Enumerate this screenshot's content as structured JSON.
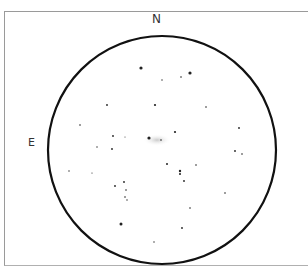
{
  "sketch": {
    "orientation": {
      "north_label": "N",
      "east_label": "E"
    },
    "field_circle": {
      "cx": 162,
      "cy": 150,
      "r": 114,
      "stroke": "#111111"
    },
    "galaxy": {
      "cx": 157,
      "cy": 140,
      "rx": 14,
      "ry": 6,
      "color": "#cfcfcf"
    },
    "stars": [
      {
        "x": 141,
        "y": 68,
        "r": 1.6
      },
      {
        "x": 190,
        "y": 73,
        "r": 1.6
      },
      {
        "x": 181,
        "y": 77,
        "r": 0.8
      },
      {
        "x": 162,
        "y": 80,
        "r": 0.7
      },
      {
        "x": 107,
        "y": 105,
        "r": 0.9
      },
      {
        "x": 155,
        "y": 105,
        "r": 1.1
      },
      {
        "x": 206,
        "y": 107,
        "r": 0.8
      },
      {
        "x": 80,
        "y": 125,
        "r": 0.8
      },
      {
        "x": 239,
        "y": 128,
        "r": 0.9
      },
      {
        "x": 175,
        "y": 132,
        "r": 1.1
      },
      {
        "x": 113,
        "y": 136,
        "r": 0.9
      },
      {
        "x": 125,
        "y": 137,
        "r": 0.5
      },
      {
        "x": 149,
        "y": 138,
        "r": 1.6
      },
      {
        "x": 161,
        "y": 140,
        "r": 0.8
      },
      {
        "x": 97,
        "y": 147,
        "r": 0.7
      },
      {
        "x": 112,
        "y": 149,
        "r": 0.9
      },
      {
        "x": 235,
        "y": 151,
        "r": 0.9
      },
      {
        "x": 242,
        "y": 154,
        "r": 0.8
      },
      {
        "x": 167,
        "y": 164,
        "r": 1.0
      },
      {
        "x": 196,
        "y": 165,
        "r": 0.8
      },
      {
        "x": 180,
        "y": 171,
        "r": 1.2
      },
      {
        "x": 180,
        "y": 174,
        "r": 1.0
      },
      {
        "x": 69,
        "y": 171,
        "r": 0.7
      },
      {
        "x": 92,
        "y": 173,
        "r": 0.6
      },
      {
        "x": 184,
        "y": 181,
        "r": 0.9
      },
      {
        "x": 124,
        "y": 182,
        "r": 0.9
      },
      {
        "x": 115,
        "y": 186,
        "r": 0.9
      },
      {
        "x": 126,
        "y": 190,
        "r": 0.8
      },
      {
        "x": 225,
        "y": 193,
        "r": 0.8
      },
      {
        "x": 125,
        "y": 197,
        "r": 0.8
      },
      {
        "x": 127,
        "y": 200,
        "r": 0.7
      },
      {
        "x": 190,
        "y": 208,
        "r": 0.8
      },
      {
        "x": 121,
        "y": 224,
        "r": 1.5
      },
      {
        "x": 182,
        "y": 228,
        "r": 0.9
      },
      {
        "x": 154,
        "y": 242,
        "r": 0.7
      }
    ]
  }
}
